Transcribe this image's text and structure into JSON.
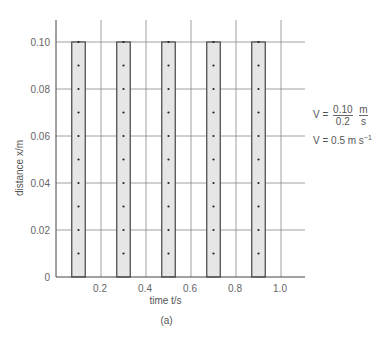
{
  "chart_data": {
    "type": "bar",
    "title": "",
    "xlabel": "time t/s",
    "ylabel": "distance x/m",
    "caption": "(a)",
    "xlim": [
      0,
      1.1
    ],
    "ylim": [
      0,
      0.11
    ],
    "grid": true,
    "x_ticks": [
      "0.2",
      "0.4",
      "0.6",
      "0.8",
      "1.0"
    ],
    "y_ticks": [
      "0",
      "0.02",
      "0.04",
      "0.06",
      "0.08",
      "0.10"
    ],
    "bars": [
      {
        "t_center": 0.1,
        "x_top": 0.1
      },
      {
        "t_center": 0.3,
        "x_top": 0.1
      },
      {
        "t_center": 0.5,
        "x_top": 0.1
      },
      {
        "t_center": 0.7,
        "x_top": 0.1
      },
      {
        "t_center": 0.9,
        "x_top": 0.1
      }
    ],
    "bar_width_s": 0.06,
    "dot_spacing_m": 0.01,
    "annotations": {
      "line1_prefix": "V =",
      "line1_num": "0.10",
      "line1_den": "0.2",
      "line1_unit_num": "m",
      "line1_unit_den": "s",
      "line2": "V = 0.5 m s",
      "line2_sup": "−1"
    }
  }
}
